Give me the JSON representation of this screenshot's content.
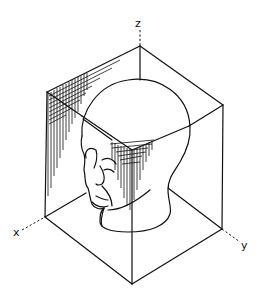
{
  "figure": {
    "colors": {
      "line": "#111111",
      "background": "#ffffff"
    },
    "axes": {
      "x": {
        "label": "x"
      },
      "y": {
        "label": "y"
      },
      "z": {
        "label": "z"
      }
    },
    "cube_vertices": {
      "top_back": [
        140,
        46
      ],
      "top_left": [
        47,
        92
      ],
      "top_right": [
        223,
        105
      ],
      "top_front": [
        132,
        150
      ],
      "bottom_left": [
        45,
        217
      ],
      "bottom_right": [
        222,
        229
      ],
      "bottom_front": [
        132,
        284
      ],
      "bottom_back_hidden": [
        140,
        172
      ]
    },
    "shaded_regions": [
      {
        "name": "left-face-hatching",
        "location": "upper part of left (x-z) face near top-left edge"
      },
      {
        "name": "front-corner-hatching",
        "location": "around front top vertex, on head surface"
      }
    ]
  }
}
